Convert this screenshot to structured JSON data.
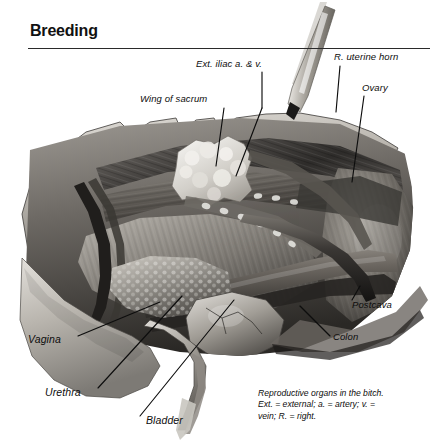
{
  "header": {
    "title": "Breeding"
  },
  "figure": {
    "labels": [
      {
        "name": "label-ext-iliac",
        "text": "Ext. iliac a. & v.",
        "x": 196,
        "y": 64
      },
      {
        "name": "label-r-uterine-horn",
        "text": "R. uterine horn",
        "x": 334,
        "y": 57
      },
      {
        "name": "label-ovary",
        "text": "Ovary",
        "x": 362,
        "y": 88
      },
      {
        "name": "label-wing-of-sacrum",
        "text": "Wing of sacrum",
        "x": 140,
        "y": 99
      },
      {
        "name": "label-postcava",
        "text": "Postcava",
        "x": 352,
        "y": 305
      },
      {
        "name": "label-colon",
        "text": "Colon",
        "x": 333,
        "y": 337
      },
      {
        "name": "label-vagina",
        "text": "Vagina",
        "x": 28,
        "y": 339
      },
      {
        "name": "label-urethra",
        "text": "Urethra",
        "x": 45,
        "y": 392
      },
      {
        "name": "label-bladder",
        "text": "Bladder",
        "x": 146,
        "y": 420
      }
    ],
    "caption": {
      "line1": "Reproductive organs in the bitch.",
      "line2": "Ext. = external; a. = artery; v. =",
      "line3": "vein; R. = right."
    }
  },
  "colors": {
    "ink": "#0d0d0d",
    "rule": "#2a2a2a",
    "page_background": "#ffffff",
    "tissue_light": "#d8d5d0",
    "tissue_mid": "#8f8c88",
    "tissue_dark": "#3c3a38",
    "tissue_deep": "#1d1c1b",
    "highlight": "#efeeea"
  }
}
